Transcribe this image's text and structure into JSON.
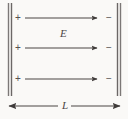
{
  "figure": {
    "name": "parallel-plate-capacitor-uniform-field",
    "background_color": "#faf9f7",
    "ink_color": "#555150",
    "width": 128,
    "height": 119
  },
  "plates": {
    "left": {
      "polarity_symbol": "+",
      "charge_count": 3,
      "charge_labels": [
        "+",
        "+",
        "+"
      ],
      "x": 10,
      "y_top": 3,
      "y_bottom": 96,
      "color": "#6b6766"
    },
    "right": {
      "polarity_symbol": "−",
      "charge_count": 3,
      "charge_labels": [
        "−",
        "−",
        "−"
      ],
      "x": 119,
      "y_top": 3,
      "y_bottom": 96,
      "color": "#6b6766"
    }
  },
  "field": {
    "label": "E",
    "label_x": 63,
    "label_y": 33,
    "direction": "left-to-right",
    "line_count": 3,
    "lines": [
      {
        "x1": 25,
        "x2": 99,
        "y": 18
      },
      {
        "x1": 25,
        "x2": 99,
        "y": 48
      },
      {
        "x1": 25,
        "x2": 99,
        "y": 79
      }
    ],
    "color": "#4a4645"
  },
  "dimension": {
    "label": "L",
    "label_x": 64,
    "label_y": 106,
    "y": 106,
    "x1": 8,
    "x2": 121,
    "arrowheads": "both",
    "color": "#4a4645"
  },
  "charge_marks": {
    "left_x": 18,
    "right_x": 107,
    "rows_y": [
      18,
      48,
      79
    ]
  }
}
